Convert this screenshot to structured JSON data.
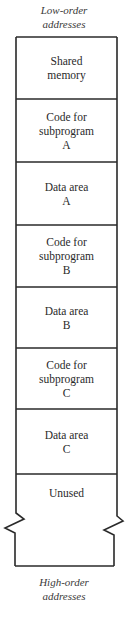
{
  "diagram": {
    "top_label": "Low-order\naddresses",
    "bottom_label": "High-order\naddresses",
    "segments": [
      {
        "label": "Shared\nmemory"
      },
      {
        "label": "Code for\nsubprogram\nA"
      },
      {
        "label": "Data area\nA"
      },
      {
        "label": "Code for\nsubprogram\nB"
      },
      {
        "label": "Data area\nB"
      },
      {
        "label": "Code for\nsubprogram\nC"
      },
      {
        "label": "Data area\nC"
      },
      {
        "label": "Unused"
      }
    ],
    "line_color": "#2a2a2a"
  }
}
